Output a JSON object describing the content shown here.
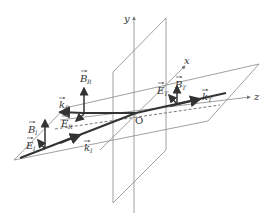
{
  "diagram": {
    "axes": {
      "x": "x",
      "y": "y",
      "z": "z",
      "origin": "O"
    },
    "vectors": {
      "incident": {
        "k": "k",
        "k_sub": "I",
        "E": "E",
        "E_sub": "I",
        "B": "B",
        "B_sub": "I"
      },
      "reflected": {
        "k": "k",
        "k_sub": "R",
        "E": "E",
        "E_sub": "R",
        "B": "B",
        "B_sub": "R"
      },
      "transmitted": {
        "k": "k",
        "k_sub": "T",
        "E": "E",
        "E_sub": "T",
        "B": "B",
        "B_sub": "T"
      }
    },
    "colors": {
      "plane": "#888888",
      "vector": "#333333",
      "text": "#333333"
    }
  }
}
